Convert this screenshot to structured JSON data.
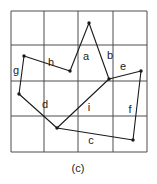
{
  "figure": {
    "caption": "(c)",
    "colors": {
      "background": "#ffffff",
      "grid": "#4d4d4d",
      "shape": "#1a1a1a",
      "label": "#1c1c1c"
    },
    "grid": {
      "cols": 4,
      "rows": 4,
      "x_lines": [
        11,
        44,
        78,
        113,
        147
      ],
      "y_lines": [
        11,
        45,
        81,
        116,
        152
      ]
    },
    "vertices": {
      "peak": {
        "x": 89,
        "y": 23
      },
      "lambda_left": {
        "x": 70,
        "y": 71
      },
      "junction_right": {
        "x": 109,
        "y": 79
      },
      "e_right": {
        "x": 141,
        "y": 71
      },
      "f_bottom": {
        "x": 133,
        "y": 140
      },
      "g_top": {
        "x": 24,
        "y": 56
      },
      "g_bottom": {
        "x": 19,
        "y": 94
      },
      "junction_bottom": {
        "x": 57,
        "y": 128
      }
    },
    "edges": [
      {
        "label": "a",
        "from": "lambda_left",
        "to": "peak"
      },
      {
        "label": "b",
        "from": "peak",
        "to": "junction_right"
      },
      {
        "label": "h",
        "from": "g_top",
        "to": "lambda_left"
      },
      {
        "label": "g",
        "from": "g_top",
        "to": "g_bottom"
      },
      {
        "label": "d",
        "from": "g_bottom",
        "to": "junction_bottom"
      },
      {
        "label": "i",
        "from": "junction_bottom",
        "to": "junction_right"
      },
      {
        "label": "e",
        "from": "junction_right",
        "to": "e_right"
      },
      {
        "label": "f",
        "from": "e_right",
        "to": "f_bottom"
      },
      {
        "label": "c",
        "from": "f_bottom",
        "to": "junction_bottom"
      }
    ],
    "labels": [
      {
        "text": "a",
        "x": 86,
        "y": 60
      },
      {
        "text": "b",
        "x": 110,
        "y": 59
      },
      {
        "text": "e",
        "x": 123,
        "y": 70
      },
      {
        "text": "h",
        "x": 51,
        "y": 66
      },
      {
        "text": "g",
        "x": 16,
        "y": 74
      },
      {
        "text": "d",
        "x": 45,
        "y": 108
      },
      {
        "text": "i",
        "x": 89,
        "y": 111
      },
      {
        "text": "f",
        "x": 130,
        "y": 113
      },
      {
        "text": "c",
        "x": 91,
        "y": 144
      }
    ],
    "caption_pos": {
      "x": 78,
      "y": 172
    },
    "dot_radius": 1.7
  }
}
